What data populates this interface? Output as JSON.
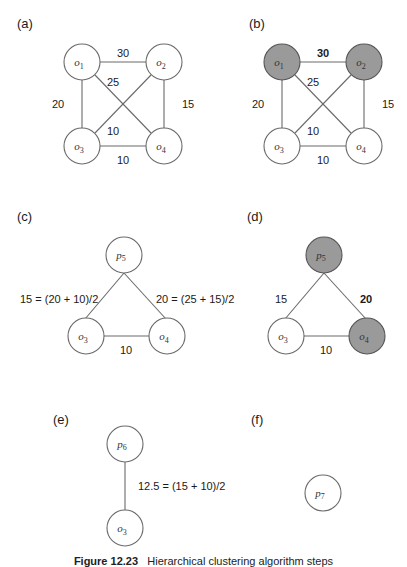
{
  "figure": {
    "caption_label": "Figure 12.23",
    "caption_text": "Hierarchical clustering algorithm steps"
  },
  "panels": {
    "a": {
      "label": "(a)",
      "nodes": [
        {
          "id": "o1",
          "base": "o",
          "sub": "1",
          "shaded": false
        },
        {
          "id": "o2",
          "base": "o",
          "sub": "2",
          "shaded": false
        },
        {
          "id": "o3",
          "base": "o",
          "sub": "3",
          "shaded": false
        },
        {
          "id": "o4",
          "base": "o",
          "sub": "4",
          "shaded": false
        }
      ],
      "edges": [
        {
          "from": "o1",
          "to": "o2",
          "weight": "30",
          "bold": false
        },
        {
          "from": "o1",
          "to": "o3",
          "weight": "20",
          "bold": false
        },
        {
          "from": "o1",
          "to": "o4",
          "weight": "25",
          "bold": false
        },
        {
          "from": "o2",
          "to": "o3",
          "weight": "10",
          "bold": false
        },
        {
          "from": "o2",
          "to": "o4",
          "weight": "15",
          "bold": false
        },
        {
          "from": "o3",
          "to": "o4",
          "weight": "10",
          "bold": false
        }
      ]
    },
    "b": {
      "label": "(b)",
      "nodes": [
        {
          "id": "o1",
          "base": "o",
          "sub": "1",
          "shaded": true
        },
        {
          "id": "o2",
          "base": "o",
          "sub": "2",
          "shaded": true
        },
        {
          "id": "o3",
          "base": "o",
          "sub": "3",
          "shaded": false
        },
        {
          "id": "o4",
          "base": "o",
          "sub": "4",
          "shaded": false
        }
      ],
      "edges": [
        {
          "from": "o1",
          "to": "o2",
          "weight": "30",
          "bold": true
        },
        {
          "from": "o1",
          "to": "o3",
          "weight": "20",
          "bold": false
        },
        {
          "from": "o1",
          "to": "o4",
          "weight": "25",
          "bold": false
        },
        {
          "from": "o2",
          "to": "o3",
          "weight": "10",
          "bold": false
        },
        {
          "from": "o2",
          "to": "o4",
          "weight": "15",
          "bold": false
        },
        {
          "from": "o3",
          "to": "o4",
          "weight": "10",
          "bold": false
        }
      ]
    },
    "c": {
      "label": "(c)",
      "nodes": [
        {
          "id": "p5",
          "base": "p",
          "sub": "5",
          "shaded": false
        },
        {
          "id": "o3",
          "base": "o",
          "sub": "3",
          "shaded": false
        },
        {
          "id": "o4",
          "base": "o",
          "sub": "4",
          "shaded": false
        }
      ],
      "edges": [
        {
          "from": "p5",
          "to": "o3",
          "weight": "15 = (20 + 10)/2",
          "bold": false
        },
        {
          "from": "p5",
          "to": "o4",
          "weight": "20 = (25 + 15)/2",
          "bold": false
        },
        {
          "from": "o3",
          "to": "o4",
          "weight": "10",
          "bold": false
        }
      ]
    },
    "d": {
      "label": "(d)",
      "nodes": [
        {
          "id": "p5",
          "base": "p",
          "sub": "5",
          "shaded": true
        },
        {
          "id": "o3",
          "base": "o",
          "sub": "3",
          "shaded": false
        },
        {
          "id": "o4",
          "base": "o",
          "sub": "4",
          "shaded": true
        }
      ],
      "edges": [
        {
          "from": "p5",
          "to": "o3",
          "weight": "15",
          "bold": false
        },
        {
          "from": "p5",
          "to": "o4",
          "weight": "20",
          "bold": true
        },
        {
          "from": "o3",
          "to": "o4",
          "weight": "10",
          "bold": false
        }
      ]
    },
    "e": {
      "label": "(e)",
      "nodes": [
        {
          "id": "p6",
          "base": "p",
          "sub": "6",
          "shaded": false
        },
        {
          "id": "o3",
          "base": "o",
          "sub": "3",
          "shaded": false
        }
      ],
      "edges": [
        {
          "from": "p6",
          "to": "o3",
          "weight": "12.5 = (15 + 10)/2",
          "bold": false
        }
      ]
    },
    "f": {
      "label": "(f)",
      "nodes": [
        {
          "id": "p7",
          "base": "p",
          "sub": "7",
          "shaded": false
        }
      ],
      "edges": []
    }
  },
  "colors": {
    "node_fill": "#ffffff",
    "node_shaded_fill": "#9a9a9a",
    "stroke": "#6a6a6a",
    "text": "#1a1a1a"
  }
}
